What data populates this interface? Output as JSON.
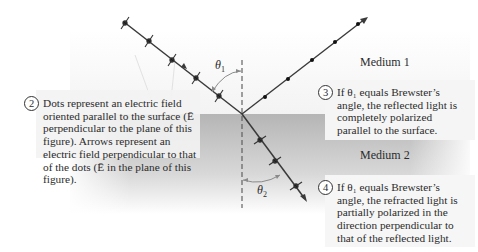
{
  "media": {
    "medium1_label": "Medium 1",
    "medium2_label": "Medium 2"
  },
  "angles": {
    "theta1_symbol": "θ",
    "theta1_sub": "1",
    "theta2_symbol": "θ",
    "theta2_sub": "2"
  },
  "notes": [
    {
      "number": "2",
      "text": "Dots represent an electric field oriented parallel to the surface (Ē perpendicular to the plane of this figure). Arrows represent an electric field perpendicular to that of the dots (Ē in the plane of this figure)."
    },
    {
      "number": "3",
      "text": "If θ₁ equals Brewster’s angle, the reflected light is completely polarized parallel to the surface."
    },
    {
      "number": "4",
      "text": "If θ₁ equals Brewster’s angle, the refracted light is partially polarized in the direction perpendicular to that of the reflected light."
    }
  ],
  "colors": {
    "medium2_fill": "#b9b9b9",
    "note_bg": "#f1f1f1",
    "ray": "#3a3a3a",
    "arc": "#8a8a8a"
  }
}
